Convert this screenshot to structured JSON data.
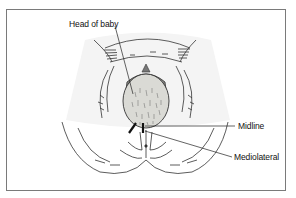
{
  "diagram": {
    "labels": {
      "head_of_baby": "Head of baby",
      "midline": "Midline",
      "mediolateral": "Mediolateral"
    },
    "colors": {
      "frame": "#7a7a7a",
      "line": "#222222",
      "head_fill": "#d9d9d4",
      "cap_fill": "#8a8a86",
      "background_glow": "#f2f2f2"
    }
  }
}
